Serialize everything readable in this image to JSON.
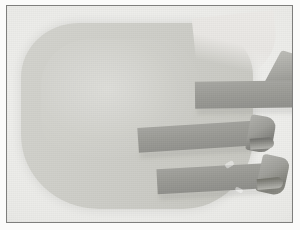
{
  "image": {
    "title": "Photographic print of a padded panel with three straps",
    "medium": "black-and-white photograph",
    "orientation": "landscape",
    "width_px": 300,
    "height_px": 230
  },
  "frame": {
    "name": "photo print border",
    "border_color": "#7e7e7c",
    "matte_color": "#fbfbfa"
  },
  "background": {
    "name": "studio paper backdrop",
    "color": "#eaeae7"
  },
  "subject": {
    "name": "rounded padded pad",
    "description": "large light-gray rounded rectangular pad occupying most of the frame",
    "color": "#cfcfc9"
  },
  "straps": [
    {
      "id": "strap-top",
      "label": "upper strap",
      "color": "#9b9b96",
      "position": "upper right",
      "end": "folded diagonally at the right frame edge"
    },
    {
      "id": "strap-middle",
      "label": "middle strap",
      "color": "#9a9a95",
      "position": "middle right",
      "end": "curled tip"
    },
    {
      "id": "strap-bottom",
      "label": "lower strap",
      "color": "#989893",
      "position": "lower right",
      "end": "curled tip"
    }
  ],
  "palette": {
    "paper": "#eaeae7",
    "pad": "#cfcfc9",
    "strap": "#9a9a95",
    "strap_shadow": "#78786f",
    "border": "#7e7e7c"
  }
}
